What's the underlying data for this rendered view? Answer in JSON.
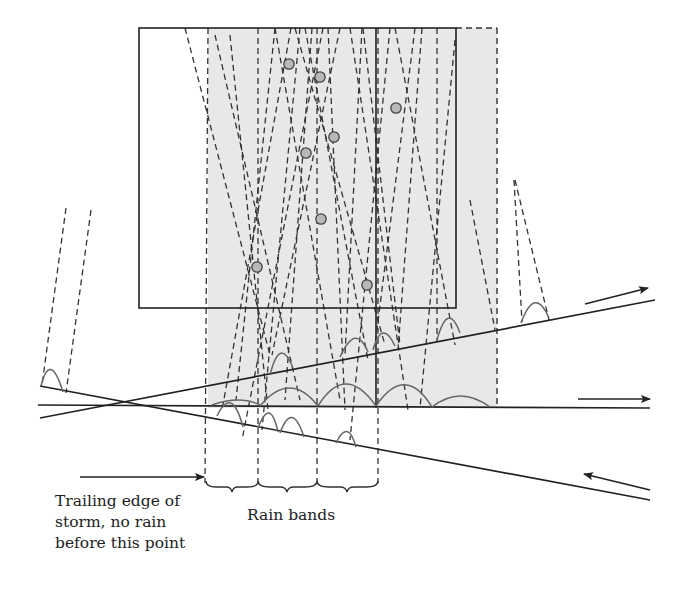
{
  "diagram": {
    "labels": {
      "trailing_line1": "Trailing edge of",
      "trailing_line2": "storm, no rain",
      "trailing_line3": "before this point",
      "rain_bands": "Rain bands"
    },
    "colors": {
      "stroke": "#222222",
      "shade": "#e6e6e6",
      "drop_fill": "#b8b8b8",
      "splash": "#666666"
    },
    "droplets": [
      {
        "x": 289,
        "y": 64
      },
      {
        "x": 320,
        "y": 77
      },
      {
        "x": 396,
        "y": 108
      },
      {
        "x": 334,
        "y": 137
      },
      {
        "x": 306,
        "y": 153
      },
      {
        "x": 321,
        "y": 219
      },
      {
        "x": 257,
        "y": 267
      },
      {
        "x": 367,
        "y": 285
      }
    ],
    "arrows": [
      {
        "name": "upper-surface-direction",
        "direction": "right-up"
      },
      {
        "name": "middle-surface-direction",
        "direction": "right"
      },
      {
        "name": "lower-surface-direction",
        "direction": "left-up"
      },
      {
        "name": "trailing-edge-pointer",
        "direction": "right"
      }
    ],
    "rain_band_bounds_x": [
      205,
      258,
      317,
      378
    ]
  }
}
